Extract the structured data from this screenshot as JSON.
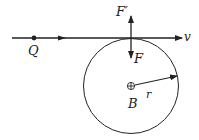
{
  "diagram": {
    "type": "physics-force-diagram",
    "labels": {
      "charge": "Q",
      "velocity": "v",
      "force": "F",
      "reaction_force": "F′",
      "magnetic_field": "B",
      "radius": "r"
    },
    "field_symbol": "circle-plus (field into page)",
    "colors": {
      "stroke": "#222222",
      "background": "#ffffff"
    }
  }
}
